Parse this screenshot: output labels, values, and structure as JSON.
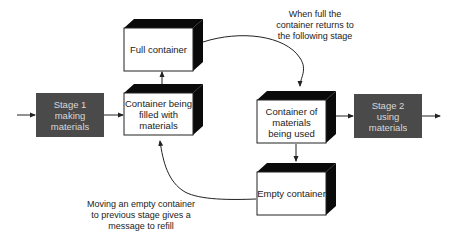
{
  "diagram": {
    "type": "kanban-two-bin-flow",
    "colors": {
      "stage_fill": "#4a4a4a",
      "stage_text": "#d8d8d8",
      "box_fill": "#ffffff",
      "box_extrusion": "#0a0a0a",
      "line": "#222222"
    },
    "stages": [
      {
        "id": "stage1",
        "lines": [
          "Stage 1",
          "making",
          "materials"
        ]
      },
      {
        "id": "stage2",
        "lines": [
          "Stage 2",
          "using",
          "materials"
        ]
      }
    ],
    "containers": [
      {
        "id": "full",
        "lines": [
          "Full container"
        ]
      },
      {
        "id": "filling",
        "lines": [
          "Container being",
          "filled with",
          "materials"
        ]
      },
      {
        "id": "in-use",
        "lines": [
          "Container of",
          "materials",
          "being used"
        ]
      },
      {
        "id": "empty",
        "lines": [
          "Empty container"
        ]
      }
    ],
    "annotations": [
      {
        "id": "full-return",
        "lines": [
          "When full the",
          "container returns to",
          "the following stage"
        ]
      },
      {
        "id": "empty-refill",
        "lines": [
          "Moving an empty container",
          "to previous stage gives a",
          "message to refill"
        ]
      }
    ]
  }
}
